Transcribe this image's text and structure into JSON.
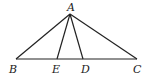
{
  "diagram": {
    "type": "geometry",
    "points": {
      "A": {
        "label": "A",
        "x": 70,
        "y": 14
      },
      "B": {
        "label": "B",
        "x": 16,
        "y": 59
      },
      "E": {
        "label": "E",
        "x": 57,
        "y": 59
      },
      "D": {
        "label": "D",
        "x": 83,
        "y": 59
      },
      "C": {
        "label": "C",
        "x": 137,
        "y": 59
      }
    },
    "segments": [
      [
        "A",
        "B"
      ],
      [
        "A",
        "C"
      ],
      [
        "B",
        "C"
      ],
      [
        "A",
        "E"
      ],
      [
        "A",
        "D"
      ]
    ],
    "stroke_color": "#222222"
  }
}
